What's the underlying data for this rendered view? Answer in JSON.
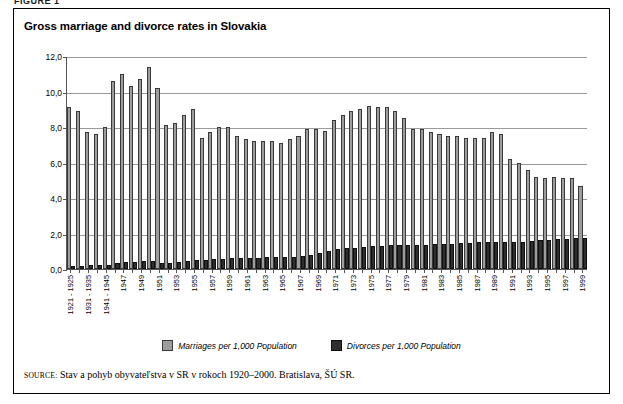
{
  "figure_label": "FIGURE 1",
  "title": "Gross marriage and divorce rates in Slovakia",
  "legend": {
    "marriages_label": "Marriages per 1,000 Population",
    "divorces_label": "Divorces per 1,000 Population"
  },
  "source": {
    "keyword": "SOURCE:",
    "text": "Stav a pohyb obyvateľstva v SR v rokoch 1920–2000. Bratislava, ŠÚ SR."
  },
  "colors": {
    "marriages": "#9d9d9d",
    "divorces": "#2e2e2e",
    "gridline": "#9a9a9a",
    "axis": "#555555",
    "frame": "#000000"
  },
  "chart_data": {
    "type": "bar",
    "title": "Gross marriage and divorce rates in Slovakia",
    "xlabel": "",
    "ylabel": "",
    "ylim": [
      0.0,
      12.0
    ],
    "yticks": [
      "0,0",
      "2,0",
      "4,0",
      "6,0",
      "8,0",
      "10,0",
      "12,0"
    ],
    "ytick_values": [
      0.0,
      2.0,
      4.0,
      6.0,
      8.0,
      10.0,
      12.0
    ],
    "grid": true,
    "legend_position": "bottom-center",
    "decimal_separator": ",",
    "categories": [
      "1921 - 1925",
      "1926 - 1930",
      "1931 - 1935",
      "1936 - 1940",
      "1941 - 1945",
      "1946",
      "1947",
      "1948",
      "1949",
      "1950",
      "1951",
      "1952",
      "1953",
      "1954",
      "1955",
      "1956",
      "1957",
      "1958",
      "1959",
      "1960",
      "1961",
      "1962",
      "1963",
      "1964",
      "1965",
      "1966",
      "1967",
      "1968",
      "1969",
      "1970",
      "1971",
      "1972",
      "1973",
      "1974",
      "1975",
      "1976",
      "1977",
      "1978",
      "1979",
      "1980",
      "1981",
      "1982",
      "1983",
      "1984",
      "1985",
      "1986",
      "1987",
      "1988",
      "1989",
      "1990",
      "1991",
      "1992",
      "1993",
      "1994",
      "1995",
      "1996",
      "1997",
      "1998",
      "1999"
    ],
    "tick_labels": [
      "1921 - 1925",
      "",
      "1931 - 1935",
      "",
      "1941 - 1945",
      "",
      "1947",
      "",
      "1949",
      "",
      "1951",
      "",
      "1953",
      "",
      "1955",
      "",
      "1957",
      "",
      "1959",
      "",
      "1961",
      "",
      "1963",
      "",
      "1965",
      "",
      "1967",
      "",
      "1969",
      "",
      "1971",
      "",
      "1973",
      "",
      "1975",
      "",
      "1977",
      "",
      "1979",
      "",
      "1981",
      "",
      "1983",
      "",
      "1985",
      "",
      "1987",
      "",
      "1989",
      "",
      "1991",
      "",
      "1993",
      "",
      "1995",
      "",
      "1997",
      "",
      "1999"
    ],
    "series": [
      {
        "name": "Marriages per 1,000 Population",
        "color": "#9d9d9d",
        "values": [
          9.1,
          8.9,
          7.7,
          7.6,
          8.0,
          10.6,
          11.0,
          10.3,
          10.7,
          11.4,
          10.2,
          8.1,
          8.2,
          8.7,
          9.0,
          7.4,
          7.7,
          8.0,
          8.0,
          7.5,
          7.3,
          7.2,
          7.2,
          7.2,
          7.1,
          7.3,
          7.5,
          7.9,
          7.9,
          7.8,
          8.4,
          8.7,
          8.9,
          9.0,
          9.2,
          9.1,
          9.1,
          8.9,
          8.5,
          7.9,
          7.9,
          7.7,
          7.6,
          7.5,
          7.5,
          7.4,
          7.4,
          7.4,
          7.7,
          7.6,
          6.2,
          6.0,
          5.6,
          5.2,
          5.1,
          5.2,
          5.1,
          5.1,
          4.7
        ]
      },
      {
        "name": "Divorces per 1,000 Population",
        "color": "#2e2e2e",
        "values": [
          0.15,
          0.15,
          0.2,
          0.2,
          0.25,
          0.35,
          0.4,
          0.4,
          0.45,
          0.45,
          0.35,
          0.35,
          0.4,
          0.45,
          0.5,
          0.5,
          0.55,
          0.55,
          0.6,
          0.6,
          0.6,
          0.6,
          0.65,
          0.65,
          0.65,
          0.7,
          0.75,
          0.8,
          0.9,
          1.0,
          1.1,
          1.2,
          1.2,
          1.25,
          1.3,
          1.3,
          1.35,
          1.35,
          1.35,
          1.35,
          1.35,
          1.4,
          1.4,
          1.4,
          1.45,
          1.45,
          1.5,
          1.55,
          1.55,
          1.55,
          1.55,
          1.55,
          1.6,
          1.65,
          1.65,
          1.7,
          1.7,
          1.75,
          1.75
        ]
      }
    ]
  }
}
